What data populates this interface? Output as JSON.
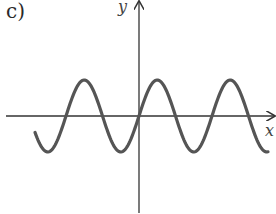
{
  "figure": {
    "label": "c)"
  },
  "chart_data": {
    "type": "line",
    "title": "",
    "xlabel": "x",
    "ylabel": "y",
    "grid": false,
    "legend": null,
    "series": [
      {
        "name": "y = sin(x)",
        "function": "sin",
        "amplitude": 1,
        "period_px": 73,
        "x_range_units": [
          -1.6,
          1.8
        ],
        "samples_px": [
          [
            35,
            130
          ],
          [
            50,
            153
          ],
          [
            87,
            80
          ],
          [
            125,
            152
          ],
          [
            139,
            116
          ],
          [
            160,
            80
          ],
          [
            198,
            152
          ],
          [
            235,
            79
          ],
          [
            268,
            150
          ]
        ]
      }
    ],
    "colors": {
      "curve": "#555555",
      "axes": "#333333"
    }
  }
}
